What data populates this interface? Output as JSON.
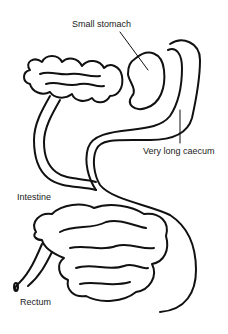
{
  "diagram": {
    "title": "",
    "labels": {
      "stomach": "Small stomach",
      "caecum": "Very long caecum",
      "intestine": "Intestine",
      "rectum": "Rectum"
    },
    "colors": {
      "stroke": "#111111",
      "background": "#ffffff",
      "text": "#222222"
    }
  }
}
